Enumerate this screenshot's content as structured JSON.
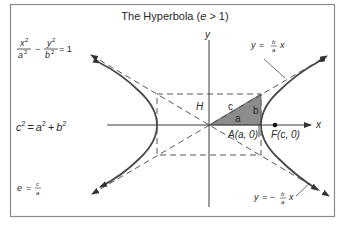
{
  "title": {
    "prefix": "The Hyperbola (",
    "var": "e",
    "suffix": " > 1)"
  },
  "formulas": {
    "equation": {
      "x_num": "x",
      "x_exp": "2",
      "x_den": "a",
      "x_den_exp": "2",
      "minus": "−",
      "y_num": "y",
      "y_exp": "2",
      "y_den": "b",
      "y_den_exp": "2",
      "rhs": "= 1"
    },
    "pythagorean": {
      "c": "c",
      "c_exp": "2",
      "eq": "=",
      "a": "a",
      "a_exp": "2",
      "plus": "+",
      "b": "b",
      "b_exp": "2"
    },
    "eccentricity": {
      "e": "e",
      "eq": "=",
      "num": "c",
      "den": "a"
    }
  },
  "axes": {
    "x_label": "x",
    "y_label": "y"
  },
  "labels": {
    "H": "H",
    "c": "c",
    "a": "a",
    "b": "b",
    "vertex": "A(a, 0)",
    "focus": "F(c, 0)"
  },
  "asymptotes": {
    "upper": {
      "y": "y",
      "eq": "=",
      "num": "b",
      "den": "a",
      "x": "x"
    },
    "lower": {
      "y": "y",
      "eq": "= −",
      "num": "b",
      "den": "a",
      "x": "x"
    }
  },
  "colors": {
    "frame": "#8a8a8a",
    "curve": "#4a4a4a",
    "triangle_fill": "#8c8c8c",
    "axis": "#3a3a3a",
    "text": "#2a2a2a"
  }
}
